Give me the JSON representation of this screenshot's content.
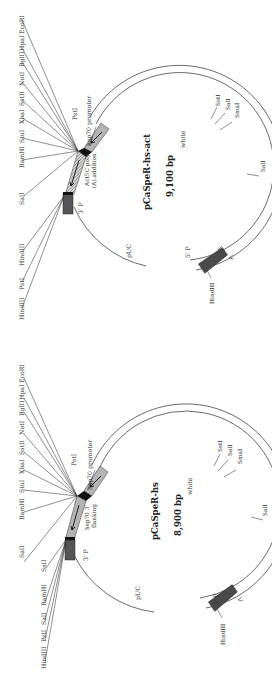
{
  "figure": {
    "orientation": "rotated-90-ccw",
    "plasmids": [
      {
        "id": "act",
        "name": "pCaSpeR-hs-act",
        "size": "9,100 bp",
        "features": {
          "promoter": "hsp70  promoter",
          "insert_line1": "Act5C poly",
          "insert_line2": "(A) addition",
          "three_p": "3' P",
          "five_p": "5' P",
          "white": "white",
          "puc": "pUC"
        },
        "mcs_sites": [
          "EcoRI",
          "HpaI",
          "BglII",
          "NotI",
          "SstII",
          "XbaI",
          "StuI",
          "BamHI",
          "SalI"
        ],
        "left_sites": [
          "HindIII",
          "PstI",
          "HindIII"
        ],
        "pstI_label": "PstI",
        "white_sites": [
          "SstI",
          "SalI",
          "SmaI"
        ],
        "white_sall": "SalI",
        "bottom_hindiii": "HindIII"
      },
      {
        "id": "hs",
        "name": "pCaSpeR-hs",
        "size": "8,900 bp",
        "features": {
          "promoter": "hsp70  promoter",
          "insert_line1": "hsp70 3'",
          "insert_line2": "flanking",
          "three_p": "3' P",
          "five_p": "5' P",
          "white": "white",
          "puc": "pUC"
        },
        "mcs_sites": [
          "EcoRI",
          "HpaI",
          "BglII",
          "NotI",
          "SstII",
          "XbaI",
          "StuI",
          "BamHI",
          "SalI"
        ],
        "left_sites": [
          "SstI",
          "BamHI",
          "SalI",
          "PstI",
          "HindIII"
        ],
        "pstI_label": "PstI",
        "white_sites": [
          "SstI",
          "SalI",
          "SmaI"
        ],
        "white_sall": "SalI",
        "bottom_hindiii": "HindIII"
      }
    ]
  }
}
